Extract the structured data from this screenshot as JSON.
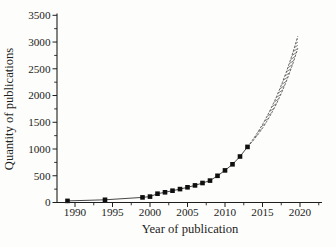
{
  "figure": {
    "background": "#fdfdfb",
    "ink": "#1e1e1e",
    "curve_color": "#3d3d3d",
    "marker_color": "#0f0f0f",
    "hatch_color": "#4d4d4d"
  },
  "chart_data": {
    "type": "scatter",
    "title": "",
    "xlabel": "Year of publication",
    "ylabel": "Quantity of publications",
    "x_ticks": [
      1990,
      1995,
      2000,
      2005,
      2010,
      2015,
      2020
    ],
    "y_ticks": [
      0,
      500,
      1000,
      1500,
      2000,
      2500,
      3000,
      3500
    ],
    "x_minor_ticks": [
      1992.5,
      1997.5,
      2002.5,
      2007.5,
      2012.5,
      2017.5,
      2022.5
    ],
    "y_minor_ticks": [
      250,
      750,
      1250,
      1750,
      2250,
      2750,
      3250
    ],
    "xlim": [
      1987.6,
      2022.9
    ],
    "ylim": [
      0,
      3500
    ],
    "grid": false,
    "legend_position": "none",
    "series": [
      {
        "name": "Publications per year",
        "marker": "filled-square",
        "line": "solid",
        "x": [
          1989,
          1994,
          1999,
          2000,
          2001,
          2002,
          2003,
          2004,
          2005,
          2006,
          2007,
          2008,
          2009,
          2010,
          2011,
          2012,
          2013
        ],
        "y": [
          30,
          50,
          95,
          110,
          165,
          190,
          220,
          250,
          285,
          320,
          365,
          410,
          500,
          600,
          715,
          860,
          1040
        ]
      }
    ],
    "projection_band": {
      "name": "Projected publications (hatched extrapolation band)",
      "x_start": 2013,
      "x_end": 2019.7,
      "value_start": 1040,
      "upper_end": 3110,
      "lower_end": 2880,
      "fill": "hatched"
    }
  }
}
